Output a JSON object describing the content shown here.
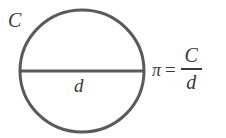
{
  "figure": {
    "background_color": "#ffffff",
    "stroke_color": "#5a5a5a",
    "text_color": "#3a3a3a",
    "circle": {
      "stroke_width": 3,
      "center_x": 64,
      "center_y": 65,
      "radius_x": 62,
      "radius_y": 61
    },
    "diameter_line": {
      "stroke_width": 3,
      "y": 65,
      "x_start": 2,
      "x_end": 126
    }
  },
  "labels": {
    "circumference": "C",
    "diameter": "d"
  },
  "equation": {
    "pi_symbol": "π",
    "equals": "=",
    "numerator": "C",
    "denominator": "d",
    "full_text": "π = C/d"
  }
}
